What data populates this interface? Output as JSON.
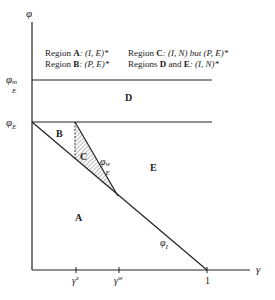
{
  "diagram": {
    "axes": {
      "y_label": "φ",
      "x_label": "γ",
      "y_ticks": [
        {
          "base": "φ",
          "sub": "E",
          "sup": "m"
        },
        {
          "base": "φ",
          "sub": "E",
          "sup": ""
        }
      ],
      "x_ticks": [
        {
          "base": "γ",
          "sup": "s"
        },
        {
          "base": "γ",
          "sup": "w"
        },
        {
          "label": "1"
        }
      ]
    },
    "legend": {
      "line1_left": {
        "prefix": "Region ",
        "region": "A",
        "text": ": (I, E)*"
      },
      "line2_left": {
        "prefix": "Region ",
        "region": "B",
        "text": ": (P, E)*"
      },
      "line1_right": {
        "prefix": "Region ",
        "region": "C",
        "text": ": (I, N) but (P, E)*"
      },
      "line2_right": {
        "prefix": "Regions ",
        "region": "D",
        "mid": " and ",
        "region2": "E",
        "text": ": (I, N)*"
      }
    },
    "regions": [
      "A",
      "B",
      "C",
      "D",
      "E"
    ],
    "curves": {
      "phi_I": {
        "base": "φ",
        "sub": "I"
      },
      "phi_E_w": {
        "base": "φ",
        "sub": "E",
        "sup": "w"
      }
    },
    "colors": {
      "line": "#222222",
      "hatch": "#555555",
      "background": "#ffffff"
    }
  }
}
